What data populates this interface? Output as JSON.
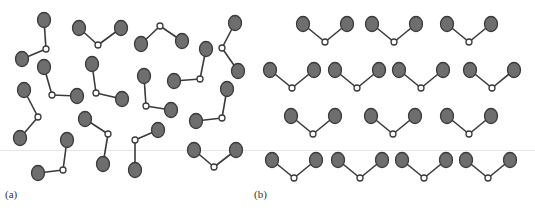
{
  "figure": {
    "panels": [
      {
        "id": "a",
        "label": "(a)",
        "label_pos": [
          13,
          196
        ],
        "arrangement": "disordered"
      },
      {
        "id": "b",
        "label": "(b)",
        "label_pos": [
          262,
          196
        ],
        "arrangement": "ordered"
      }
    ],
    "colors": {
      "outer_atom_fill": "#6e6e6e",
      "outer_atom_stroke": "#3a3a3a",
      "center_atom_fill": "#ffffff",
      "center_atom_stroke": "#3a3a3a",
      "bond": "#3a3a3a",
      "divider": "#e6e6e6"
    },
    "divider_y": 150
  },
  "molecules": {
    "a": [
      {
        "c": [
          46,
          49
        ],
        "p": [
          [
            44,
            20
          ],
          [
            22,
            59
          ]
        ]
      },
      {
        "c": [
          98,
          45
        ],
        "p": [
          [
            79,
            28
          ],
          [
            121,
            28
          ]
        ]
      },
      {
        "c": [
          160,
          26
        ],
        "p": [
          [
            141,
            44
          ],
          [
            182,
            41
          ]
        ]
      },
      {
        "c": [
          222,
          48
        ],
        "p": [
          [
            235,
            23
          ],
          [
            238,
            71
          ]
        ]
      },
      {
        "c": [
          200,
          79
        ],
        "p": [
          [
            206,
            49
          ],
          [
            174,
            81
          ]
        ]
      },
      {
        "c": [
          52,
          95
        ],
        "p": [
          [
            44,
            67
          ],
          [
            77,
            96
          ]
        ]
      },
      {
        "c": [
          96,
          93
        ],
        "p": [
          [
            92,
            64
          ],
          [
            122,
            99
          ]
        ]
      },
      {
        "c": [
          146,
          106
        ],
        "p": [
          [
            144,
            76
          ],
          [
            171,
            110
          ]
        ]
      },
      {
        "c": [
          38,
          117
        ],
        "p": [
          [
            24,
            90
          ],
          [
            20,
            138
          ]
        ]
      },
      {
        "c": [
          222,
          118
        ],
        "p": [
          [
            227,
            89
          ],
          [
            196,
            121
          ]
        ]
      },
      {
        "c": [
          108,
          134
        ],
        "p": [
          [
            85,
            119
          ],
          [
            103,
            164
          ]
        ]
      },
      {
        "c": [
          135,
          140
        ],
        "p": [
          [
            158,
            130
          ],
          [
            135,
            170
          ]
        ]
      },
      {
        "c": [
          63,
          170
        ],
        "p": [
          [
            67,
            140
          ],
          [
            38,
            173
          ]
        ]
      },
      {
        "c": [
          214,
          167
        ],
        "p": [
          [
            194,
            150
          ],
          [
            236,
            150
          ]
        ]
      }
    ],
    "b": [
      {
        "c": [
          325,
          42
        ]
      },
      {
        "c": [
          394,
          42
        ]
      },
      {
        "c": [
          469,
          42
        ]
      },
      {
        "c": [
          292,
          88
        ]
      },
      {
        "c": [
          357,
          88
        ]
      },
      {
        "c": [
          421,
          88
        ]
      },
      {
        "c": [
          492,
          88
        ]
      },
      {
        "c": [
          313,
          134
        ]
      },
      {
        "c": [
          393,
          134
        ]
      },
      {
        "c": [
          469,
          134
        ]
      },
      {
        "c": [
          294,
          178
        ]
      },
      {
        "c": [
          360,
          178
        ]
      },
      {
        "c": [
          424,
          178
        ]
      },
      {
        "c": [
          488,
          178
        ]
      }
    ]
  }
}
